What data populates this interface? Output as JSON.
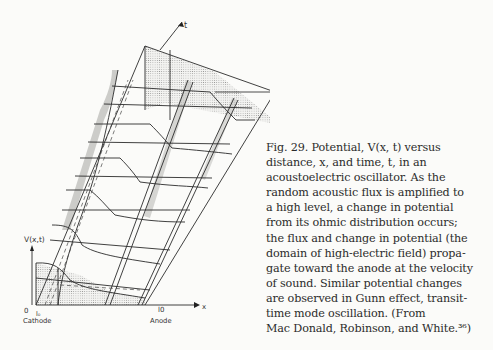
{
  "figure": {
    "number_label": "Fig. 29.",
    "axes": {
      "vertical_label": "V(x,t)",
      "time_axis_label": "t",
      "tau_label": "τ",
      "x_axis_label": "x",
      "origin_label": "0",
      "l0_label": "l₀",
      "anode_tick_label": "l0",
      "cathode_label": "Cathode",
      "anode_label": "Anode"
    }
  },
  "caption": {
    "lines": [
      "Fig. 29.  Potential, V(x, t) versus",
      "distance, x, and time, t, in an",
      "acoustoelectric oscillator.  As the",
      "random acoustic flux is amplified to",
      "a high level, a change in potential",
      "from its ohmic distribution occurs;",
      "the flux and change in potential (the",
      "domain of high-electric field) propa-",
      "gate toward the anode at the velocity",
      "of sound.  Similar potential changes",
      "are observed in Gunn effect, transit-",
      "time mode oscillation.  (From",
      "Mac Donald, Robinson, and White.³⁶)"
    ]
  }
}
